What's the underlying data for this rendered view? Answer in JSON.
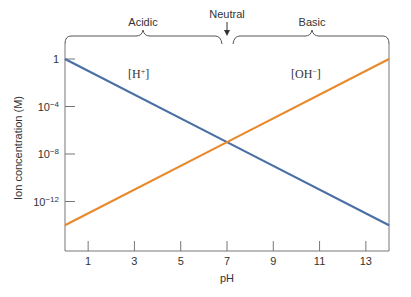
{
  "chart_data": {
    "type": "line",
    "title": "",
    "xlabel": "pH",
    "ylabel": "Ion concentration (M)",
    "xlim": [
      0,
      14
    ],
    "ylim_log10": [
      -14,
      0.5
    ],
    "yscale": "log",
    "grid": false,
    "x_ticks": [
      1,
      3,
      5,
      7,
      9,
      11,
      13
    ],
    "x_tick_labels": [
      "1",
      "3",
      "5",
      "7",
      "9",
      "11",
      "13"
    ],
    "y_ticks_log10": [
      0,
      -4,
      -8,
      -12
    ],
    "y_tick_labels": [
      {
        "base": "1",
        "exp": ""
      },
      {
        "base": "10",
        "exp": "−4"
      },
      {
        "base": "10",
        "exp": "−8"
      },
      {
        "base": "10",
        "exp": "−12"
      }
    ],
    "series": [
      {
        "name": "[H⁺]",
        "label_base": "[H",
        "label_sup": "+",
        "label_end": "]",
        "color": "#4a6fa5",
        "x": [
          0,
          7,
          14
        ],
        "log10_y": [
          0,
          -7,
          -14
        ]
      },
      {
        "name": "[OH⁻]",
        "label_base": "[OH",
        "label_sup": "−",
        "label_end": "]",
        "color": "#e8892b",
        "x": [
          0,
          7,
          14
        ],
        "log10_y": [
          -14,
          -7,
          0
        ]
      }
    ],
    "annotations": {
      "acidic": "Acidic",
      "neutral": "Neutral",
      "basic": "Basic"
    }
  }
}
